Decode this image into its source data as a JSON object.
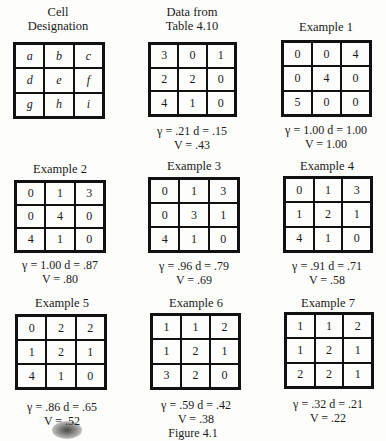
{
  "figure": {
    "caption": "Figure 4.1",
    "panels": [
      {
        "title": "Cell Designation",
        "cells": [
          "a",
          "b",
          "c",
          "d",
          "e",
          "f",
          "g",
          "h",
          "i"
        ],
        "gamma": "",
        "d": "",
        "V": ""
      },
      {
        "title": "Data from Table 4.10",
        "cells": [
          "3",
          "0",
          "1",
          "2",
          "2",
          "0",
          "4",
          "1",
          "0"
        ],
        "stats_line1": "γ = .21  d = .15",
        "stats_line2": "V = .43"
      },
      {
        "title": "Example 1",
        "cells": [
          "0",
          "0",
          "4",
          "0",
          "4",
          "0",
          "5",
          "0",
          "0"
        ],
        "stats_line1": "γ = 1.00  d = 1.00",
        "stats_line2": "V = 1.00"
      },
      {
        "title": "Example 2",
        "cells": [
          "0",
          "1",
          "3",
          "0",
          "4",
          "0",
          "4",
          "1",
          "0"
        ],
        "stats_line1": "γ = 1.00  d = .87",
        "stats_line2": "V = .80"
      },
      {
        "title": "Example 3",
        "cells": [
          "0",
          "1",
          "3",
          "0",
          "3",
          "1",
          "4",
          "1",
          "0"
        ],
        "stats_line1": "γ = .96  d = .79",
        "stats_line2": "V = .69"
      },
      {
        "title": "Example 4",
        "cells": [
          "0",
          "1",
          "3",
          "1",
          "2",
          "1",
          "4",
          "1",
          "0"
        ],
        "stats_line1": "γ = .91  d = .71",
        "stats_line2": "V = .58"
      },
      {
        "title": "Example 5",
        "cells": [
          "0",
          "2",
          "2",
          "1",
          "2",
          "1",
          "4",
          "1",
          "0"
        ],
        "stats_line1": "γ = .86  d = .65",
        "stats_line2": "V = .52"
      },
      {
        "title": "Example 6",
        "cells": [
          "1",
          "1",
          "2",
          "1",
          "2",
          "1",
          "3",
          "2",
          "0"
        ],
        "stats_line1": "γ = .59  d = .42",
        "stats_line2": "V = .38"
      },
      {
        "title": "Example 7",
        "cells": [
          "1",
          "1",
          "2",
          "1",
          "2",
          "1",
          "2",
          "2",
          "1"
        ],
        "stats_line1": "γ = .32  d = .21",
        "stats_line2": "V = .22"
      }
    ],
    "cell_designation_title_line1": "Cell",
    "cell_designation_title_line2": "Designation",
    "data_title_line1": "Data from",
    "data_title_line2": "Table 4.10"
  }
}
